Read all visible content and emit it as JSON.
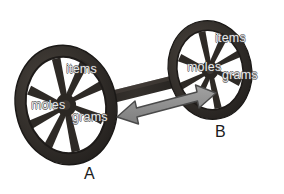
{
  "figure": {
    "background_color": "#ffffff",
    "wheel_color": "#2b2825",
    "wheel_highlight_color": "#4a443e",
    "axle_color": "#262321",
    "arrow_fill_color": "#8f8f8f",
    "arrow_outline_color": "#4a4a4a",
    "label_text_color": "#e8e8e8",
    "wheel_name_color": "#1b1b1b"
  },
  "wheels": [
    {
      "id": "wheel-a",
      "name": "A",
      "labels": {
        "items": "items",
        "moles": "moles",
        "grams": "grams"
      }
    },
    {
      "id": "wheel-b",
      "name": "B",
      "labels": {
        "items": "items",
        "moles": "moles",
        "grams": "grams"
      }
    }
  ],
  "connector": {
    "type": "double-headed-arrow",
    "direction": "bidirectional"
  }
}
